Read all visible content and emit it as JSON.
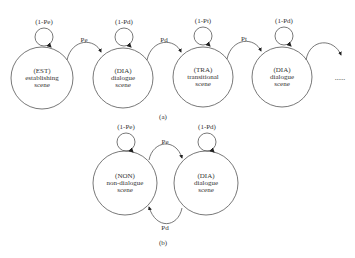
{
  "diagram_a": {
    "caption": "(a)",
    "states": [
      {
        "code": "(EST)",
        "line1": "establishing",
        "line2": "scene",
        "self_loop": "(1-Pe)"
      },
      {
        "code": "(DIA)",
        "line1": "dialogue",
        "line2": "scene",
        "self_loop": "(1-Pd)"
      },
      {
        "code": "(TRA)",
        "line1": "transitional",
        "line2": "scene",
        "self_loop": "(1-Pt)"
      },
      {
        "code": "(DIA)",
        "line1": "dialogue",
        "line2": "scene",
        "self_loop": "(1-Pd)"
      }
    ],
    "transitions": [
      "Pe",
      "Pd",
      "Pt"
    ],
    "continuation": "......"
  },
  "diagram_b": {
    "caption": "(b)",
    "states": [
      {
        "code": "(NON)",
        "line1": "non-dialogue",
        "line2": "scene",
        "self_loop": "(1-Pe)"
      },
      {
        "code": "(DIA)",
        "line1": "dialogue",
        "line2": "scene",
        "self_loop": "(1-Pd)"
      }
    ],
    "transitions": [
      "Pe",
      "Pd"
    ]
  }
}
